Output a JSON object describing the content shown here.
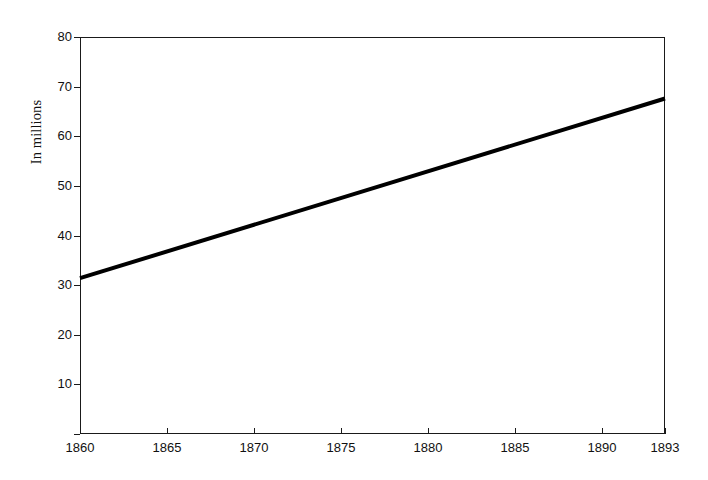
{
  "chart_data": {
    "type": "line",
    "title": "",
    "subtitle": "",
    "xlabel": "",
    "ylabel": "In millions",
    "xlim": [
      1860,
      1893
    ],
    "ylim": [
      0,
      80
    ],
    "grid": false,
    "legend": false,
    "x_tick_labels": [
      "1860",
      "1865",
      "1870",
      "1875",
      "1880",
      "1885",
      "1890",
      "1893"
    ],
    "x_ticks": [
      1860,
      1865,
      1870,
      1875,
      1880,
      1885,
      1890,
      1893
    ],
    "y_tick_labels": [
      "10",
      "20",
      "30",
      "40",
      "50",
      "60",
      "70",
      "80"
    ],
    "y_ticks": [
      10,
      20,
      30,
      40,
      50,
      60,
      70,
      80
    ],
    "series": [
      {
        "name": "Population",
        "x": [
          1860,
          1893
        ],
        "values": [
          31.4,
          67.6
        ],
        "color": "#000000",
        "line_width": 4
      }
    ]
  },
  "axis": {
    "frame_color": "#1a1a1a",
    "tick_color": "#1a1a1a",
    "text_color": "#111111"
  }
}
